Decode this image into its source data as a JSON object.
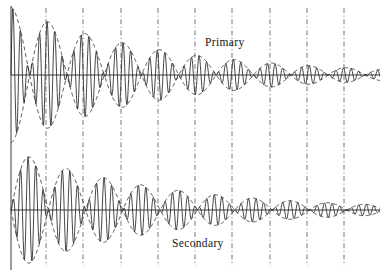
{
  "figure": {
    "kind": "waveform-diagram",
    "title": "",
    "caption": "",
    "background_color": "#ffffff",
    "ink_color": "#25262b",
    "envelope_color": "#3a3b40",
    "tie_line_color": "#55565c"
  },
  "labels": {
    "primary": "Primary",
    "secondary": "Secondary"
  },
  "chart_data": {
    "type": "line",
    "title": "",
    "xlabel": "",
    "ylabel": "",
    "grid": false,
    "legend": "inline-annotation",
    "xlim": [
      0,
      388
    ],
    "axes": [
      {
        "name": "Primary",
        "baseline_y": 75,
        "x_start": 11,
        "x_end": 380,
        "max_amplitude": 68
      },
      {
        "name": "Secondary",
        "baseline_y": 210,
        "x_start": 11,
        "x_end": 380,
        "max_amplitude": 60
      }
    ],
    "series": [
      {
        "name": "Primary",
        "baseline_y": 75,
        "envelope_phase": "cosine",
        "initial_amplitude": 68,
        "decay_constant_px": 150,
        "beat_half_period_px": 37.3,
        "carrier_period_px": 7.6,
        "envelope_style": "dashed",
        "carrier_style": "solid"
      },
      {
        "name": "Secondary",
        "baseline_y": 210,
        "envelope_phase": "sine",
        "initial_amplitude": 60,
        "decay_constant_px": 150,
        "beat_half_period_px": 37.3,
        "carrier_period_px": 7.6,
        "envelope_style": "dashed",
        "carrier_style": "solid"
      }
    ],
    "tie_lines": {
      "style": "dash-dot",
      "count": 9,
      "x_positions": [
        46,
        83,
        121,
        158,
        195,
        232,
        270,
        307,
        344
      ],
      "y_top": 8,
      "y_bottom": 266
    },
    "vertical_axis": {
      "x": 11,
      "y_top": 6,
      "y_bottom": 270
    }
  }
}
